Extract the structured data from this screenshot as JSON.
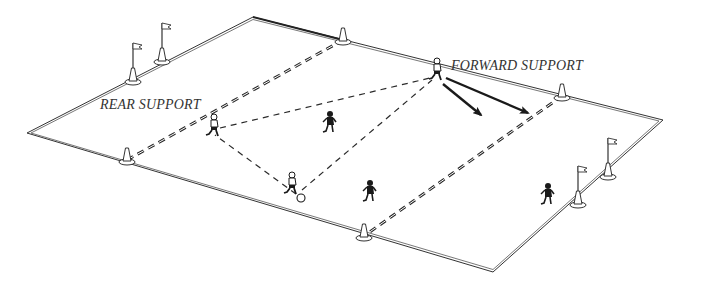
{
  "diagram": {
    "labels": {
      "rear_support": "REAR SUPPORT",
      "forward_support": "FORWARD SUPPORT"
    },
    "colors": {
      "line": "#333333",
      "dashed": "#2a2a2a",
      "player": "#1a1a1a",
      "background": "#ffffff"
    },
    "field": {
      "corners": {
        "top": [
          253,
          17
        ],
        "right": [
          663,
          120
        ],
        "bottom": [
          493,
          272
        ],
        "left": [
          27,
          133
        ]
      }
    },
    "zone_lines": [
      {
        "name": "left-zone-line",
        "from": [
          343,
          40
        ],
        "to": [
          127,
          160
        ]
      },
      {
        "name": "right-zone-line",
        "from": [
          562,
          96
        ],
        "to": [
          364,
          236
        ]
      }
    ],
    "cones": [
      {
        "name": "cone-top-left",
        "pos": [
          343,
          40
        ]
      },
      {
        "name": "cone-top-right",
        "pos": [
          562,
          96
        ]
      },
      {
        "name": "cone-bottom-left",
        "pos": [
          127,
          160
        ]
      },
      {
        "name": "cone-bottom-right",
        "pos": [
          364,
          236
        ]
      }
    ],
    "flags": [
      {
        "name": "flag-left-1",
        "pos": [
          133,
          80
        ]
      },
      {
        "name": "flag-left-2",
        "pos": [
          162,
          60
        ]
      },
      {
        "name": "flag-right-1",
        "pos": [
          578,
          203
        ]
      },
      {
        "name": "flag-right-2",
        "pos": [
          608,
          175
        ]
      }
    ],
    "players": [
      {
        "name": "rear-support-player",
        "pos": [
          212,
          130
        ],
        "shirt": "dark"
      },
      {
        "name": "forward-support-player",
        "pos": [
          437,
          72
        ],
        "shirt": "light"
      },
      {
        "name": "ball-carrier-player",
        "pos": [
          290,
          186
        ],
        "shirt": "light"
      },
      {
        "name": "midfield-player",
        "pos": [
          330,
          125
        ],
        "shirt": "dark"
      },
      {
        "name": "defender-player",
        "pos": [
          369,
          190
        ],
        "shirt": "dark"
      },
      {
        "name": "goalkeeper-player",
        "pos": [
          548,
          200
        ],
        "shirt": "dark"
      }
    ],
    "ball": {
      "pos": [
        300,
        198
      ]
    },
    "support_lines": [
      {
        "from": [
          296,
          194
        ],
        "to": [
          215,
          135
        ]
      },
      {
        "from": [
          296,
          194
        ],
        "to": [
          432,
          80
        ]
      },
      {
        "from": [
          215,
          130
        ],
        "to": [
          432,
          76
        ]
      }
    ],
    "arrows": [
      {
        "name": "run-arrow-1",
        "from": [
          443,
          83
        ],
        "to": [
          483,
          116
        ]
      },
      {
        "name": "run-arrow-2",
        "from": [
          445,
          77
        ],
        "to": [
          530,
          114
        ]
      }
    ]
  }
}
